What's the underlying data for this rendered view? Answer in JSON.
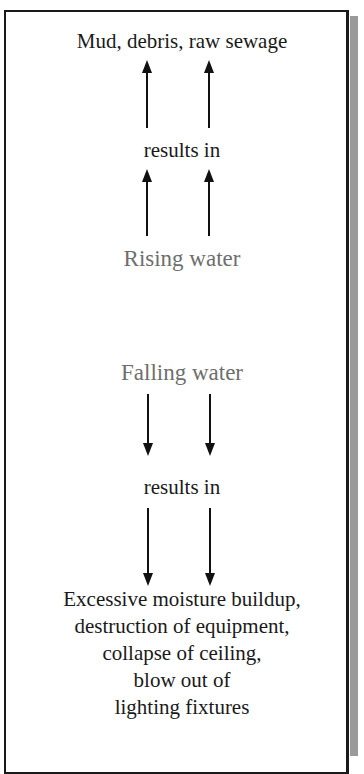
{
  "diagram": {
    "top_effect": "Mud, debris, raw sewage",
    "connector_upper": "results in",
    "cause_rising": "Rising water",
    "cause_falling": "Falling water",
    "connector_lower": "results in",
    "bottom_effects": [
      "Excessive moisture  buildup,",
      "destruction of equipment,",
      "collapse of ceiling,",
      "blow out of",
      "lighting fixtures"
    ],
    "colors": {
      "border": "#1a1a1a",
      "text": "#1a1a1a",
      "cause_text": "#6e6e6e",
      "shadow": "#9a9a9a"
    }
  }
}
